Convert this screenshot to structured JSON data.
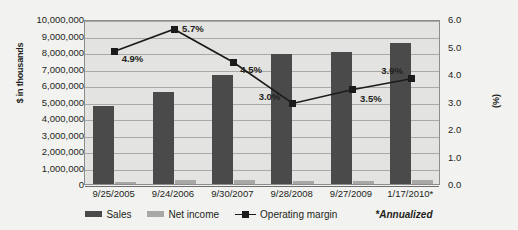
{
  "chart_data": {
    "type": "bar",
    "title": "",
    "subtitle": "",
    "xlabel": "",
    "ylabel": "$ in thousands",
    "y2label": "(%)",
    "grid": true,
    "legend_position": "bottom",
    "categories": [
      "9/25/2005",
      "9/24/2006",
      "9/30/2007",
      "9/28/2008",
      "9/27/2009",
      "1/17/2010*"
    ],
    "ylim": [
      0,
      10000000
    ],
    "y2lim": [
      0.0,
      6.0
    ],
    "yticks": [
      "0",
      "1,000,000",
      "2,000,000",
      "3,000,000",
      "4,000,000",
      "5,000,000",
      "6,000,000",
      "7,000,000",
      "8,000,000",
      "9,000,000",
      "10,000,000"
    ],
    "y2ticks": [
      "0.0",
      "1.0",
      "2.0",
      "3.0",
      "4.0",
      "5.0",
      "6.0"
    ],
    "series": [
      {
        "name": "Sales",
        "type": "bar",
        "axis": "left",
        "color": "#4a4a4a",
        "values": [
          4700000,
          5600000,
          6600000,
          7900000,
          8000000,
          8550000
        ]
      },
      {
        "name": "Net income",
        "type": "bar",
        "axis": "left",
        "color": "#a8a8a6",
        "values": [
          150000,
          270000,
          220000,
          180000,
          200000,
          260000
        ]
      },
      {
        "name": "Operating margin",
        "type": "line",
        "axis": "right",
        "color": "#1b1b1b",
        "values": [
          4.9,
          5.7,
          4.5,
          3.0,
          3.5,
          3.9
        ],
        "labels": [
          "4.9%",
          "5.7%",
          "4.5%",
          "3.0%",
          "3.5%",
          "3.9%"
        ]
      }
    ],
    "annotations": [
      {
        "text": "*Annualized",
        "position": "bottom-right",
        "italic": true
      }
    ]
  },
  "legend": {
    "items": [
      {
        "label": "Sales",
        "marker": "bar-swatch"
      },
      {
        "label": "Net income",
        "marker": "bar-swatch"
      },
      {
        "label": "Operating margin",
        "marker": "line-swatch"
      }
    ],
    "note": "*Annualized"
  }
}
